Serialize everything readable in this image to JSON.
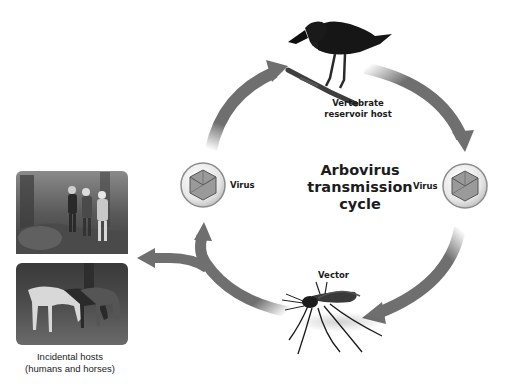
{
  "diagram": {
    "title_lines": [
      "Arbovirus",
      "transmission",
      "cycle"
    ],
    "reservoir": {
      "label_lines": [
        "Vertebrate",
        "reservoir host"
      ],
      "icon": "crow-icon"
    },
    "virus_left": {
      "label": "Virus",
      "icon": "icosahedral-virus-icon"
    },
    "virus_right": {
      "label": "Virus",
      "icon": "icosahedral-virus-icon"
    },
    "vector": {
      "label": "Vector",
      "icon": "mosquito-icon"
    },
    "incidental_hosts": {
      "caption_lines": [
        "Incidental hosts",
        "(humans and horses)"
      ],
      "photos": [
        {
          "name": "humans-walking-photo",
          "subject": "hikers in forest"
        },
        {
          "name": "horses-grazing-photo",
          "subject": "horses grazing"
        }
      ]
    },
    "colors": {
      "arrow": "#6f6f6f",
      "text": "#1a1a1a",
      "background": "#ffffff",
      "virus_ring": "#b9b9b9"
    }
  }
}
